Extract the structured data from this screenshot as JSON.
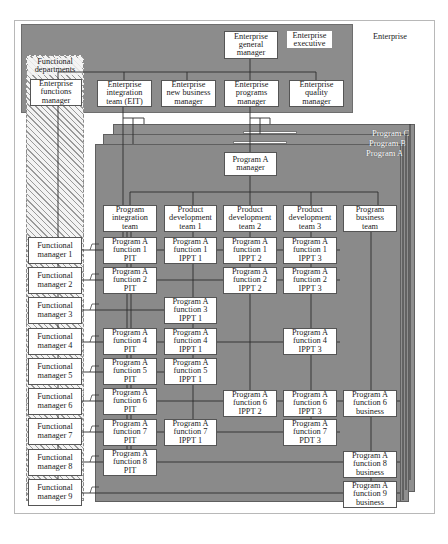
{
  "enterprise": {
    "label": "Enterprise",
    "executive_label": "Enterprise\nexecutive",
    "general_manager": "Enterprise\ngeneral\nmanager",
    "functional_departments_label": "Functional\ndepartments",
    "functions_manager": "Enterprise\nfunctions\nmanager",
    "direct_reports": [
      {
        "id": "eit",
        "label": "Enterprise\nintegration\nteam (EIT)"
      },
      {
        "id": "new-business",
        "label": "Enterprise\nnew business\nmanager"
      },
      {
        "id": "programs",
        "label": "Enterprise\nprograms\nmanager"
      },
      {
        "id": "quality",
        "label": "Enterprise\nquality\nmanager"
      }
    ]
  },
  "programs": {
    "layers": [
      "Program C",
      "Program B",
      "Program A"
    ],
    "program_manager": "Program A\nmanager",
    "teams": [
      {
        "id": "pit",
        "label": "Program\nintegration\nteam"
      },
      {
        "id": "pdt1",
        "label": "Product\ndevelopment\nteam 1"
      },
      {
        "id": "pdt2",
        "label": "Product\ndevelopment\nteam 2"
      },
      {
        "id": "pdt3",
        "label": "Product\ndevelopment\nteam 3"
      },
      {
        "id": "business",
        "label": "Program\nbusiness\nteam"
      }
    ]
  },
  "functional_managers": [
    "Functional\nmanager 1",
    "Functional\nmanager 2",
    "Functional\nmanager 3",
    "Functional\nmanager 4",
    "Functional\nmanager 5",
    "Functional\nmanager 6",
    "Functional\nmanager 7",
    "Functional\nmanager 8",
    "Functional\nmanager 9"
  ],
  "function_cells": {
    "row1": [
      "Program A\nfunction 1\nPIT",
      "Program A\nfunction 1\nIPPT 1",
      "Program A\nfunction 1\nIPPT 2",
      "Program A\nfunction 1\nIPPT 3",
      null
    ],
    "row2": [
      "Program A\nfunction 2\nPIT",
      null,
      "Program A\nfunction 2\nIPPT 2",
      "Program A\nfunction 2\nIPPT 3",
      null
    ],
    "row3": [
      null,
      "Program A\nfunction 3\nIPPT 1",
      null,
      null,
      null
    ],
    "row4": [
      "Program A\nfunction 4\nPIT",
      "Program A\nfunction 4\nIPPT 1",
      null,
      "Program A\nfunction 4\nIPPT 3",
      null
    ],
    "row5": [
      "Program A\nfunction 5\nPIT",
      "Program A\nfunction 5\nIPPT 1",
      null,
      null,
      null
    ],
    "row6": [
      "Program A\nfunction 6\nPIT",
      null,
      "Program A\nfunction 6\nIPPT 2",
      "Program A\nfunction 6\nIPPT 3",
      "Program A\nfunction 6\nbusiness"
    ],
    "row7": [
      "Program A\nfunction 7\nPIT",
      "Program A\nfunction 7\nIPPT 1",
      null,
      "Program A\nfunction 7\nPDT 3",
      null
    ],
    "row8": [
      "Program A\nfunction 8\nPIT",
      null,
      null,
      null,
      "Program A\nfunction 8\nbusiness"
    ],
    "row9": [
      null,
      null,
      null,
      null,
      "Program A\nfunction 9\nbusiness"
    ]
  },
  "colors": {
    "band_gray": "#8c8c8c",
    "program_gray": "#8f8f8f",
    "box_fill": "#ffffff",
    "line": "#2e2e2e",
    "hatch": "#9a9a9a"
  }
}
